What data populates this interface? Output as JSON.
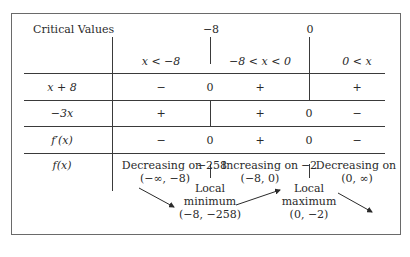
{
  "table": {
    "header_label": "Critical Values",
    "critical_values": [
      "−8",
      "0"
    ],
    "intervals": [
      "x < −8",
      "−8 < x < 0",
      "0 < x"
    ],
    "rows": [
      {
        "label": "x + 8",
        "cells": [
          "−",
          "0",
          "+",
          "",
          "+"
        ]
      },
      {
        "label": "−3x",
        "cells": [
          "+",
          "",
          "+",
          "0",
          "−"
        ]
      },
      {
        "label": "f′(x)",
        "cells": [
          "−",
          "0",
          "+",
          "0",
          "−"
        ]
      }
    ],
    "f_row": {
      "label": "f(x)",
      "seg1_line1": "Decreasing on",
      "seg1_line2": "(−∞, −8)",
      "cv1_value": "−258",
      "seg2_line1": "Increasing on",
      "seg2_line2": "(−8, 0)",
      "cv2_value": "−2",
      "seg3_line1": "Decreasing on",
      "seg3_line2": "(0, ∞)",
      "min_line1": "Local",
      "min_line2": "minimum",
      "min_line3": "(−8, −258)",
      "max_line1": "Local",
      "max_line2": "maximum",
      "max_line3": "(0, −2)"
    }
  }
}
